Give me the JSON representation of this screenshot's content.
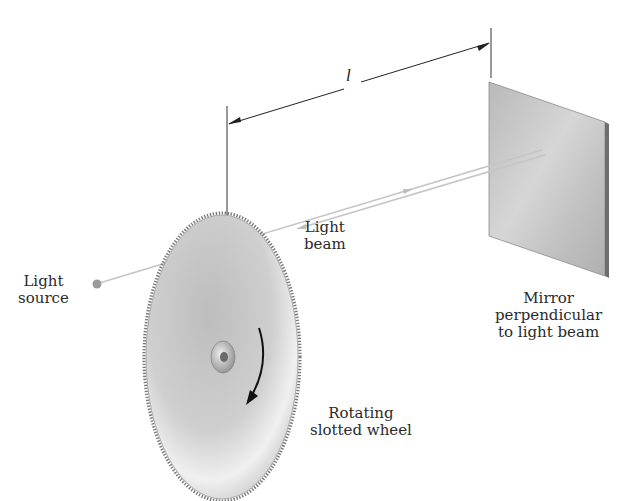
{
  "figure": {
    "distance_symbol": "l",
    "labels": {
      "light_source": [
        "Light",
        "source"
      ],
      "light_beam": [
        "Light",
        "beam"
      ],
      "mirror": [
        "Mirror",
        "perpendicular",
        "to light beam"
      ],
      "wheel": [
        "Rotating",
        "slotted wheel"
      ]
    },
    "colors": {
      "beam": "#c8c8c8",
      "source_dot": "#9a9a9a",
      "mirror_face": "#c4c4c4",
      "mirror_edge": "#6e6e6e",
      "wheel_face": "#c9c9c9",
      "wheel_teeth": "#7a7a7a",
      "dimension_line": "#222222",
      "rotation_arrow": "#111111"
    },
    "wheel": {
      "rotation": "clockwise"
    }
  }
}
